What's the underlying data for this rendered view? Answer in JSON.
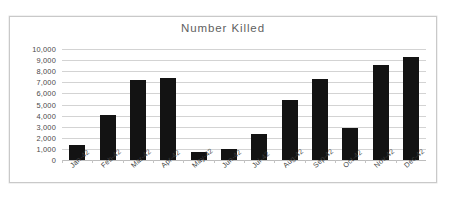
{
  "chart_data": {
    "type": "bar",
    "title": "Number Killed",
    "xlabel": "",
    "ylabel": "",
    "categories": [
      "Jan-42",
      "Feb-42",
      "Mar-42",
      "Apr-42",
      "May-42",
      "Jun-42",
      "Jul-42",
      "Aug-42",
      "Sep-42",
      "Oct-42",
      "Nov-42",
      "Dec-42"
    ],
    "values": [
      1350,
      4050,
      7250,
      7400,
      750,
      1000,
      2300,
      5450,
      7300,
      2850,
      8550,
      9300
    ],
    "ylim": [
      0,
      10000
    ],
    "ytick_step": 1000,
    "ytick_labels": [
      "10,000",
      "9,000",
      "8,000",
      "7,000",
      "6,000",
      "5,000",
      "4,000",
      "3,000",
      "2,000",
      "1,000",
      "0"
    ],
    "grid": true,
    "legend": false,
    "bar_color": "#131313",
    "grid_color": "#d3d3d3",
    "title_color": "#5f5f5f",
    "frame_color": "#c9c9c9"
  }
}
